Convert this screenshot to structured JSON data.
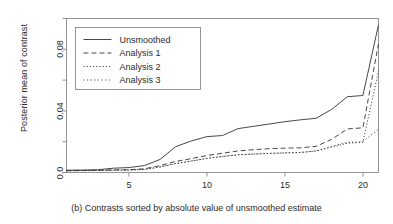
{
  "chart_data": {
    "type": "line",
    "title": "",
    "caption": "(b) Contrasts sorted by absolute value of unsmoothed estimate",
    "xlabel": "",
    "ylabel": "Posterior mean of contrast",
    "xlim": [
      1,
      21
    ],
    "ylim": [
      0.0,
      0.1
    ],
    "xticks": [
      5,
      10,
      15,
      20
    ],
    "xtick_labels": [
      "5",
      "10",
      "15",
      "20"
    ],
    "yticks": [
      0.0,
      0.04,
      0.08
    ],
    "ytick_labels": [
      "0.0",
      "0.04",
      "0.08"
    ],
    "grid": false,
    "legend_position": "top-left",
    "box": true,
    "x": [
      1,
      2,
      3,
      4,
      5,
      6,
      7,
      8,
      9,
      10,
      11,
      12,
      13,
      14,
      15,
      16,
      17,
      18,
      19,
      20,
      21
    ],
    "series": [
      {
        "name": "Unsmoothed",
        "style": "solid",
        "color": "#333333",
        "values": [
          0.0015,
          0.0016,
          0.0018,
          0.0028,
          0.0032,
          0.0045,
          0.0085,
          0.0168,
          0.0205,
          0.0233,
          0.024,
          0.0285,
          0.03,
          0.0315,
          0.033,
          0.0342,
          0.0352,
          0.041,
          0.0492,
          0.05,
          0.096
        ]
      },
      {
        "name": "Analysis 1",
        "style": "dashed",
        "color": "#333333",
        "values": [
          0.0012,
          0.0013,
          0.0014,
          0.0017,
          0.0018,
          0.0024,
          0.0045,
          0.0072,
          0.009,
          0.011,
          0.0125,
          0.014,
          0.0148,
          0.0155,
          0.0158,
          0.016,
          0.017,
          0.0215,
          0.0283,
          0.029,
          0.0835
        ]
      },
      {
        "name": "Analysis 2",
        "style": "dotted",
        "color": "#333333",
        "values": [
          0.0011,
          0.0012,
          0.0013,
          0.0015,
          0.0016,
          0.002,
          0.0036,
          0.0058,
          0.0074,
          0.0092,
          0.0104,
          0.0115,
          0.012,
          0.0124,
          0.0127,
          0.013,
          0.014,
          0.0165,
          0.019,
          0.0196,
          0.066
        ]
      },
      {
        "name": "Analysis 3",
        "style": "dashdot",
        "color": "#333333",
        "values": [
          0.0011,
          0.0012,
          0.0013,
          0.0015,
          0.0016,
          0.002,
          0.0036,
          0.0058,
          0.0074,
          0.0092,
          0.0104,
          0.0115,
          0.012,
          0.0124,
          0.0127,
          0.013,
          0.014,
          0.017,
          0.0196,
          0.02,
          0.0282
        ]
      }
    ],
    "legend_entries": [
      "Unsmoothed",
      "Analysis 1",
      "Analysis 2",
      "Analysis 3"
    ]
  }
}
